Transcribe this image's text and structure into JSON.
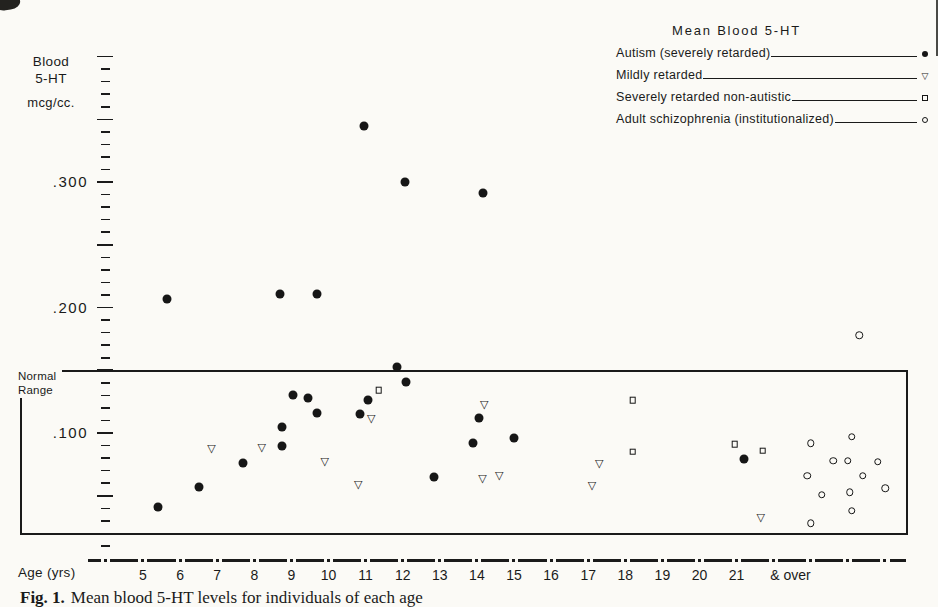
{
  "colors": {
    "ink": "#1a1a1a",
    "background": "#fbfaf6"
  },
  "header": {
    "y_axis_title": {
      "line1": "Blood",
      "line2": "5-HT",
      "line3": "mcg/cc."
    },
    "x_axis_title": "Age (yrs)"
  },
  "normal_range": {
    "label_line1": "Normal",
    "label_line2": "Range"
  },
  "legend": {
    "title": "Mean Blood 5-HT",
    "entries": [
      {
        "label": "Autism (severely retarded)",
        "marker": "filled-circle"
      },
      {
        "label": "Mildly retarded",
        "marker": "open-triangle"
      },
      {
        "label": "Severely retarded non-autistic",
        "marker": "open-square"
      },
      {
        "label": "Adult schizophrenia (institutionalized)",
        "marker": "open-circle"
      }
    ]
  },
  "caption": {
    "prefix": "Fig. 1.",
    "text": "Mean blood 5-HT levels for individuals of each age"
  },
  "chart_data": {
    "type": "scatter",
    "title": "Mean Blood 5-HT",
    "xlabel": "Age (yrs)",
    "ylabel": "Blood 5-HT mcg/cc.",
    "xlim": [
      4,
      26
    ],
    "ylim": [
      0,
      0.41
    ],
    "grid": false,
    "legend_position": "top-right",
    "normal_range_top": 0.15,
    "y_labels": [
      {
        "label": ".300",
        "value": 0.3
      },
      {
        "label": ".200",
        "value": 0.2
      },
      {
        "label": ".100",
        "value": 0.1
      }
    ],
    "y_minor_tick_step": 0.01,
    "y_major_tick_step": 0.05,
    "y_tick_range": [
      0.01,
      0.4
    ],
    "x_ticks": [
      {
        "label": "5",
        "age": 5
      },
      {
        "label": "6",
        "age": 6
      },
      {
        "label": "7",
        "age": 7
      },
      {
        "label": "8",
        "age": 8
      },
      {
        "label": "9",
        "age": 9
      },
      {
        "label": "10",
        "age": 10
      },
      {
        "label": "11",
        "age": 11
      },
      {
        "label": "12",
        "age": 12
      },
      {
        "label": "13",
        "age": 13
      },
      {
        "label": "14",
        "age": 14
      },
      {
        "label": "15",
        "age": 15
      },
      {
        "label": "16",
        "age": 16
      },
      {
        "label": "17",
        "age": 17
      },
      {
        "label": "18",
        "age": 18
      },
      {
        "label": "19",
        "age": 19
      },
      {
        "label": "20",
        "age": 20
      },
      {
        "label": "21",
        "age": 21
      },
      {
        "label": "& over",
        "age": 22.45
      }
    ],
    "series": [
      {
        "name": "Autism (severely retarded)",
        "marker": "filled-circle",
        "points": [
          [
            5.4,
            0.041
          ],
          [
            5.65,
            0.207
          ],
          [
            6.5,
            0.057
          ],
          [
            7.7,
            0.076
          ],
          [
            8.7,
            0.211
          ],
          [
            8.75,
            0.105
          ],
          [
            8.75,
            0.09
          ],
          [
            9.05,
            0.13
          ],
          [
            9.45,
            0.128
          ],
          [
            9.7,
            0.211
          ],
          [
            9.7,
            0.116
          ],
          [
            10.85,
            0.115
          ],
          [
            10.95,
            0.345
          ],
          [
            11.05,
            0.126
          ],
          [
            11.85,
            0.153
          ],
          [
            12.05,
            0.3
          ],
          [
            12.1,
            0.141
          ],
          [
            12.85,
            0.065
          ],
          [
            13.9,
            0.092
          ],
          [
            14.05,
            0.112
          ],
          [
            14.15,
            0.291
          ],
          [
            15.0,
            0.096
          ],
          [
            21.2,
            0.079
          ]
        ]
      },
      {
        "name": "Mildly retarded",
        "marker": "open-triangle",
        "points": [
          [
            6.85,
            0.087
          ],
          [
            8.2,
            0.088
          ],
          [
            9.9,
            0.077
          ],
          [
            10.8,
            0.059
          ],
          [
            11.15,
            0.111
          ],
          [
            14.2,
            0.122
          ],
          [
            14.15,
            0.063
          ],
          [
            14.6,
            0.066
          ],
          [
            17.1,
            0.058
          ],
          [
            17.3,
            0.075
          ],
          [
            21.65,
            0.032
          ]
        ]
      },
      {
        "name": "Severely retarded non-autistic",
        "marker": "open-square",
        "points": [
          [
            11.35,
            0.134
          ],
          [
            18.2,
            0.126
          ],
          [
            18.2,
            0.085
          ],
          [
            20.95,
            0.091
          ],
          [
            21.7,
            0.086
          ]
        ]
      },
      {
        "name": "Adult schizophrenia (institutionalized)",
        "marker": "open-circle",
        "points": [
          [
            24.3,
            0.178
          ],
          [
            23.0,
            0.092
          ],
          [
            24.1,
            0.097
          ],
          [
            23.6,
            0.078
          ],
          [
            24.0,
            0.078
          ],
          [
            24.8,
            0.077
          ],
          [
            22.9,
            0.066
          ],
          [
            24.4,
            0.066
          ],
          [
            23.3,
            0.051
          ],
          [
            24.05,
            0.053
          ],
          [
            25.0,
            0.056
          ],
          [
            24.1,
            0.038
          ],
          [
            23.0,
            0.028
          ]
        ]
      }
    ]
  }
}
